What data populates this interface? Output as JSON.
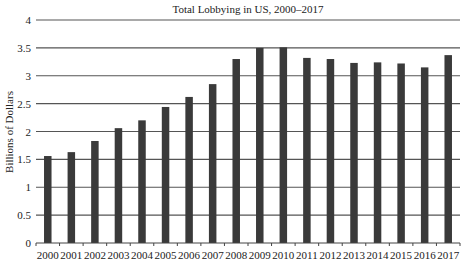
{
  "chart_data": {
    "type": "bar",
    "title": "Total Lobbying in US, 2000–2017",
    "xlabel": "",
    "ylabel": "Billions of Dollars",
    "categories": [
      "2000",
      "2001",
      "2002",
      "2003",
      "2004",
      "2005",
      "2006",
      "2007",
      "2008",
      "2009",
      "2010",
      "2011",
      "2012",
      "2013",
      "2014",
      "2015",
      "2016",
      "2017"
    ],
    "values": [
      1.56,
      1.63,
      1.83,
      2.06,
      2.2,
      2.44,
      2.62,
      2.85,
      3.3,
      3.5,
      3.51,
      3.32,
      3.3,
      3.23,
      3.24,
      3.22,
      3.15,
      3.37
    ],
    "ylim": [
      0,
      4
    ],
    "yticks": [
      0,
      0.5,
      1,
      1.5,
      2,
      2.5,
      3,
      3.5,
      4
    ],
    "ytick_labels": [
      "0",
      "0.5",
      "1",
      "1.5",
      "2",
      "2.5",
      "3",
      "3.5",
      "4"
    ],
    "grid": true,
    "legend": null,
    "colors": {
      "bar": "#3a3a3a",
      "grid": "#555555",
      "axis": "#444444",
      "background": "#ffffff"
    }
  }
}
